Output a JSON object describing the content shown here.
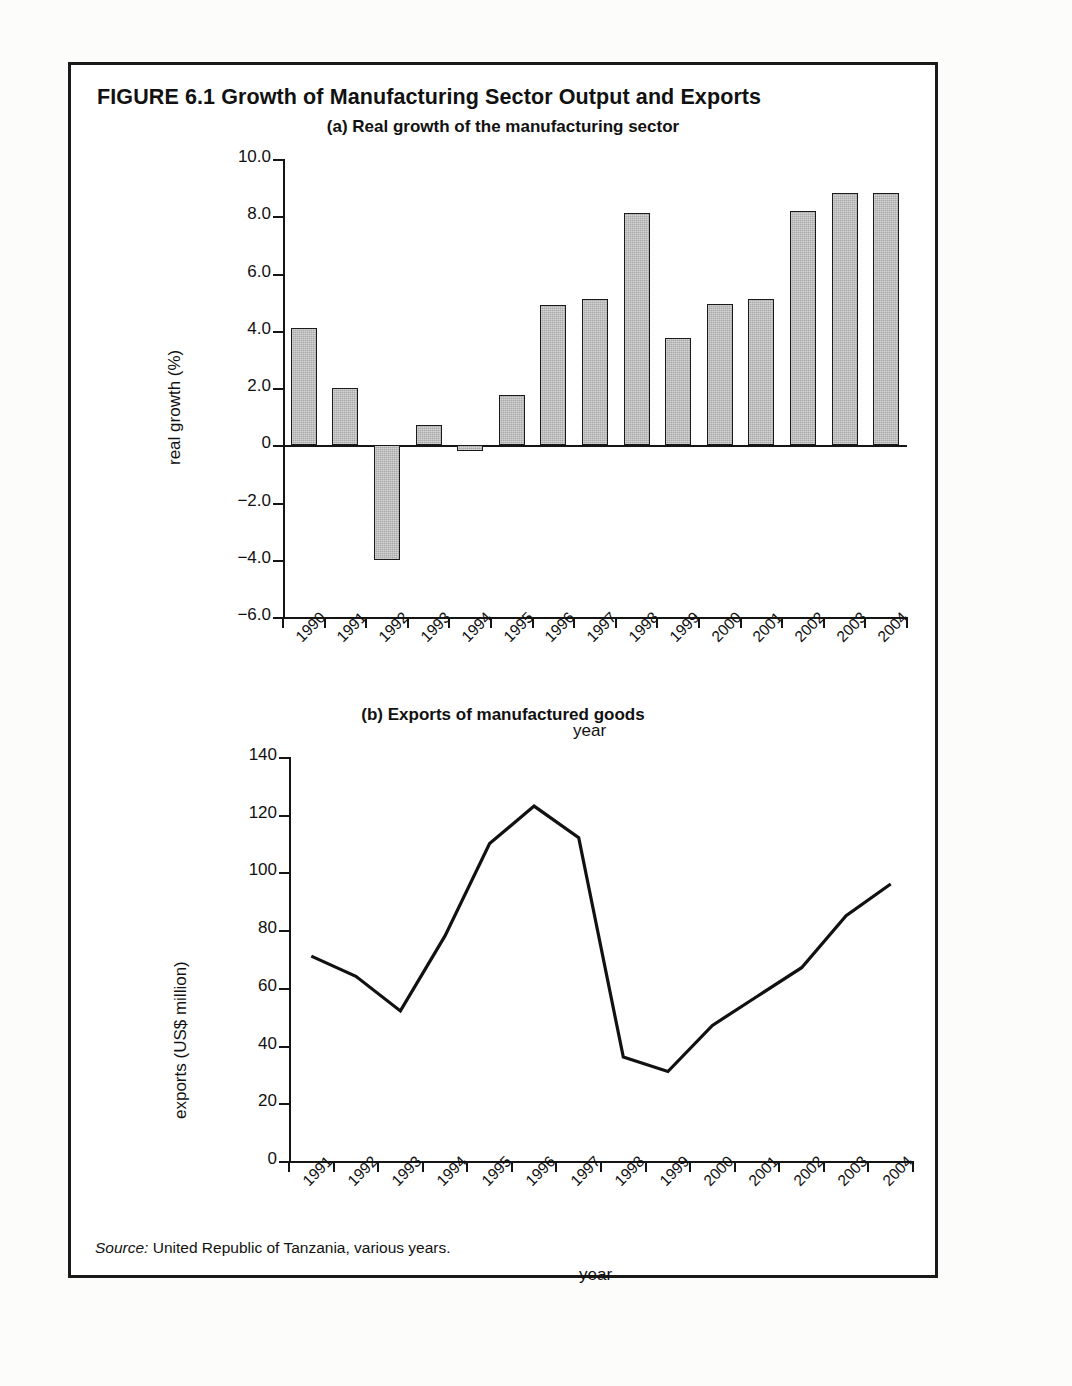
{
  "figure": {
    "title": "FIGURE 6.1  Growth of Manufacturing Sector Output and Exports",
    "source_label": "Source:",
    "source_text": "United Republic of Tanzania, various years."
  },
  "panel_a": {
    "title": "(a) Real growth of the manufacturing sector",
    "xlabel": "year",
    "ylabel": "real growth (%)"
  },
  "panel_b": {
    "title": "(b) Exports of manufactured goods",
    "xlabel": "year",
    "ylabel": "exports (US$ million)"
  },
  "chart_data": [
    {
      "type": "bar",
      "title": "(a) Real growth of the manufacturing sector",
      "xlabel": "year",
      "ylabel": "real growth (%)",
      "categories": [
        "1990",
        "1991",
        "1992",
        "1993",
        "1994",
        "1995",
        "1996",
        "1997",
        "1998",
        "1999",
        "2000",
        "2001",
        "2002",
        "2003",
        "2004"
      ],
      "values": [
        4.1,
        2.0,
        -4.0,
        0.7,
        -0.2,
        1.75,
        4.9,
        5.1,
        8.1,
        3.75,
        4.95,
        5.1,
        8.2,
        8.8,
        8.8
      ],
      "ylim": [
        -6.0,
        10.0
      ],
      "yticks": [
        10.0,
        8.0,
        6.0,
        4.0,
        2.0,
        0,
        -2.0,
        -4.0,
        -6.0
      ],
      "ytick_labels": [
        "10.0",
        "8.0",
        "6.0",
        "4.0",
        "2.0",
        "0",
        "−2.0",
        "−4.0",
        "−6.0"
      ],
      "grid": false,
      "legend": "none",
      "bar_color": "#a9a9a9",
      "bar_edge_color": "#1b1b1b"
    },
    {
      "type": "line",
      "title": "(b) Exports of manufactured goods",
      "xlabel": "year",
      "ylabel": "exports (US$ million)",
      "categories": [
        "1991",
        "1992",
        "1993",
        "1994",
        "1995",
        "1996",
        "1997",
        "1998",
        "1999",
        "2000",
        "2001",
        "2002",
        "2003",
        "2004"
      ],
      "values": [
        71,
        64,
        52,
        78,
        110,
        123,
        112,
        36,
        31,
        47,
        57,
        67,
        85,
        96
      ],
      "ylim": [
        0,
        140
      ],
      "yticks": [
        140,
        120,
        100,
        80,
        60,
        40,
        20,
        0
      ],
      "ytick_labels": [
        "140",
        "120",
        "100",
        "80",
        "60",
        "40",
        "20",
        "0"
      ],
      "grid": false,
      "legend": "none",
      "line_color": "#111111"
    }
  ]
}
